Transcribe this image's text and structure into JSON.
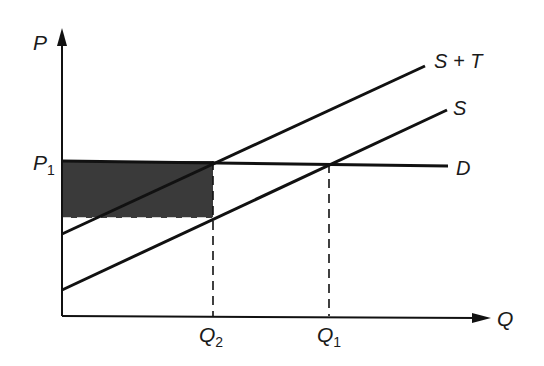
{
  "diagram": {
    "type": "supply-demand-tax",
    "axes": {
      "y_label": "P",
      "x_label": "Q"
    },
    "price_labels": {
      "p1_main": "P",
      "p1_sub": "1"
    },
    "quantity_labels": {
      "q2_main": "Q",
      "q2_sub": "2",
      "q1_main": "Q",
      "q1_sub": "1"
    },
    "curves": [
      {
        "name": "S + T",
        "label": "S + T",
        "from": [
          62,
          234
        ],
        "to": [
          425,
          66
        ]
      },
      {
        "name": "S",
        "label": "S",
        "from": [
          62,
          290
        ],
        "to": [
          447,
          110
        ]
      },
      {
        "name": "D",
        "label": "D",
        "from": [
          62,
          161
        ],
        "to": [
          448,
          166
        ]
      }
    ],
    "shaded_region": {
      "description": "tax revenue rectangle",
      "x": [
        62,
        213
      ],
      "y": [
        161,
        218
      ],
      "color": "#3a3a3a"
    },
    "colors": {
      "line": "#111111",
      "shade": "#3a3a3a",
      "background": "#ffffff"
    }
  }
}
